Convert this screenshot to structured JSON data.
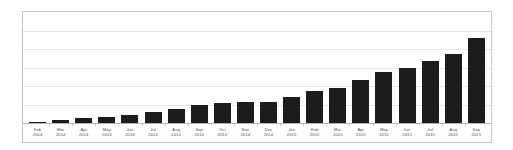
{
  "chart_data": {
    "type": "bar",
    "title": "",
    "subtitle": "",
    "xlabel": "",
    "ylabel": "",
    "legend": [],
    "legend_position": "none",
    "grid": true,
    "gridlines_count": 5,
    "axis_tick_labels_visible": false,
    "ylim": [
      0,
      6
    ],
    "categories": [
      "Feb 2014",
      "Mar 2014",
      "Apr 2014",
      "May 2014",
      "Jun 2014",
      "Jul 2014",
      "Aug 2014",
      "Sep 2014",
      "Oct 2014",
      "Nov 2014",
      "Dec 2014",
      "Jan 2015",
      "Feb 2015",
      "Mar 2015",
      "Apr 2015",
      "May 2015",
      "Jun 2015",
      "Jul 2015",
      "Aug 2015",
      "Sep 2015"
    ],
    "category_months": [
      "Feb",
      "Mar",
      "Apr",
      "May",
      "Jun",
      "Jul",
      "Aug",
      "Sep",
      "Oct",
      "Nov",
      "Dec",
      "Jan",
      "Feb",
      "Mar",
      "Apr",
      "May",
      "Jun",
      "Jul",
      "Aug",
      "Sep"
    ],
    "category_years": [
      "2014",
      "2014",
      "2014",
      "2014",
      "2014",
      "2014",
      "2014",
      "2014",
      "2014",
      "2014",
      "2014",
      "2015",
      "2015",
      "2015",
      "2015",
      "2015",
      "2015",
      "2015",
      "2015",
      "2015"
    ],
    "values": [
      0.05,
      0.15,
      0.25,
      0.3,
      0.45,
      0.6,
      0.75,
      0.95,
      1.1,
      1.15,
      1.15,
      1.4,
      1.75,
      1.9,
      2.3,
      2.75,
      2.95,
      3.35,
      3.75,
      4.6
    ],
    "bar_color": "#1c1c1c",
    "gridline_color": "#e6e6e6",
    "frame_color": "#c8c8c8",
    "background_color": "#ffffff",
    "label_color": "#4a4a4a"
  }
}
